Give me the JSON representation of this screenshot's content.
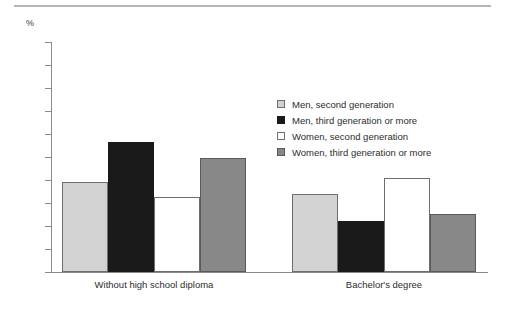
{
  "chart_data": {
    "type": "bar",
    "title": "",
    "subtitle": "",
    "xlabel": "",
    "ylabel": "%",
    "ylim": [
      0,
      50
    ],
    "ytick_step": 5,
    "yticks": [
      50,
      45,
      40,
      35,
      30,
      25,
      20,
      15,
      10,
      5,
      0
    ],
    "grid": false,
    "legend_position": "center-right",
    "categories": [
      "Without high school diploma",
      "Bachelor's degree"
    ],
    "series": [
      {
        "name": "Men, second generation",
        "color": "#d2d2d2",
        "values": [
          19.6,
          17.0
        ]
      },
      {
        "name": "Men, third generation or more",
        "color": "#1a1a1a",
        "values": [
          28.3,
          11.1
        ]
      },
      {
        "name": "Women, second generation",
        "color": "#ffffff",
        "values": [
          16.3,
          20.4
        ]
      },
      {
        "name": "Women, third generation or more",
        "color": "#888888",
        "values": [
          24.8,
          12.6
        ]
      }
    ]
  },
  "axis": {
    "unit_label": "%"
  },
  "legend": {
    "entries": [
      "Men, second generation",
      "Men, third generation or more",
      "Women, second generation",
      "Women, third generation or more"
    ]
  },
  "colors": {
    "series_0": "#d2d2d2",
    "series_1": "#1a1a1a",
    "series_2": "#ffffff",
    "series_3": "#888888",
    "axis": "#8a8a8a",
    "rule": "#b5b5b5",
    "text": "#2d2d2d"
  }
}
